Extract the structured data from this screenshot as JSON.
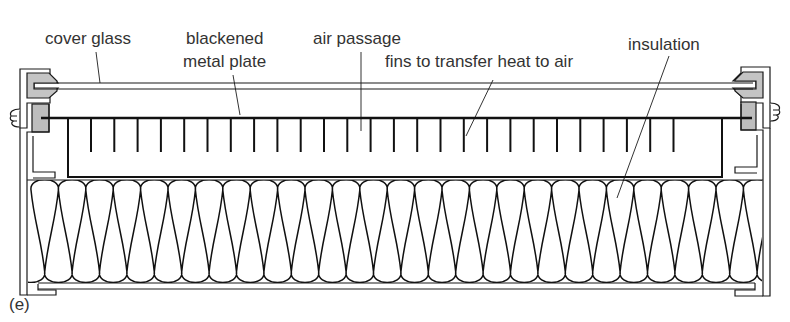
{
  "figure": {
    "caption": "(e)"
  },
  "labels": {
    "cover_glass": "cover glass",
    "blackened_metal_plate": [
      "blackened",
      "metal plate"
    ],
    "air_passage": "air passage",
    "fins": "fins to transfer heat to air",
    "insulation": "insulation"
  },
  "colors": {
    "line": "#1a1a1a",
    "text": "#333333",
    "seal_fill": "#c4c4c4",
    "gasket_fill": "#bdbdbd",
    "background": "#ffffff"
  },
  "geometry": {
    "fin_count": 27,
    "fin_start_x": 91,
    "fin_spacing": 23.3,
    "insulation_loops": 27,
    "insulation_start_x": 31,
    "insulation_period": 27.4
  }
}
